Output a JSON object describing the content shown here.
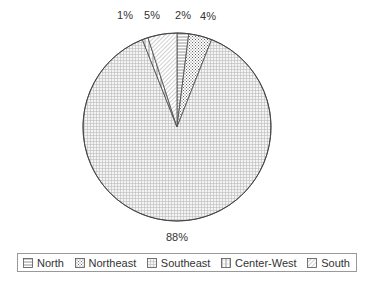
{
  "chart_data": {
    "type": "pie",
    "title": "",
    "categories": [
      "North",
      "Northeast",
      "Southeast",
      "Center-West",
      "South"
    ],
    "values": [
      2,
      4,
      88,
      1,
      5
    ],
    "labels": [
      "2%",
      "4%",
      "88%",
      "1%",
      "5%"
    ],
    "start_angle_deg": 0,
    "direction": "clockwise",
    "legend_position": "bottom",
    "patterns": [
      "horizontal-lines",
      "checker-dots",
      "fine-grid",
      "vertical-grid",
      "diagonal-hatch"
    ]
  },
  "legend": {
    "items": [
      {
        "label": "North",
        "pattern": "horizontal-lines"
      },
      {
        "label": "Northeast",
        "pattern": "checker-dots"
      },
      {
        "label": "Southeast",
        "pattern": "fine-grid"
      },
      {
        "label": "Center-West",
        "pattern": "vertical-grid"
      },
      {
        "label": "South",
        "pattern": "diagonal-hatch"
      }
    ]
  }
}
